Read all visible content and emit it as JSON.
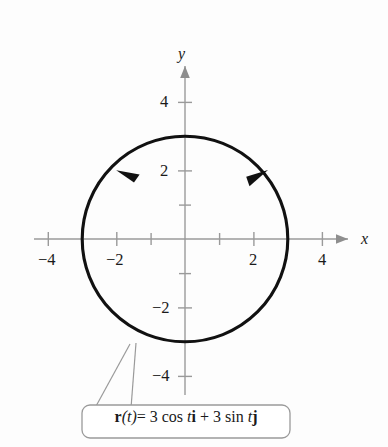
{
  "figure": {
    "type": "parametric-curve-plot"
  },
  "axes": {
    "x_label": "x",
    "y_label": "y",
    "x_ticks_labeled": [
      {
        "value": -4,
        "text": "−4"
      },
      {
        "value": -2,
        "text": "−2"
      },
      {
        "value": 2,
        "text": "2"
      },
      {
        "value": 4,
        "text": "4"
      }
    ],
    "y_ticks_labeled": [
      {
        "value": 4,
        "text": "4"
      },
      {
        "value": 2,
        "text": "2"
      },
      {
        "value": -2,
        "text": "−2"
      },
      {
        "value": -4,
        "text": "−4"
      }
    ],
    "x_ticks_all": [
      -4,
      -3,
      -2,
      -1,
      1,
      2,
      3,
      4
    ],
    "y_ticks_all": [
      -4,
      -3,
      -2,
      -1,
      1,
      2,
      3,
      4
    ],
    "xlim": [
      -4.6,
      4.6
    ],
    "ylim": [
      -4.6,
      4.6
    ],
    "grid": false
  },
  "curve": {
    "equation_parts": {
      "r": "r",
      "paren_t": "(t)",
      "equals": "= 3 cos ",
      "t1": "t",
      "i": "i",
      "plus": " + 3 sin ",
      "t2": "t",
      "j": "j"
    },
    "center": [
      0,
      0
    ],
    "radius": 3,
    "orientation": "counterclockwise",
    "direction_arrows": [
      {
        "angle_deg": 132,
        "points": "counterclockwise"
      },
      {
        "angle_deg": 38,
        "points": "counterclockwise"
      }
    ],
    "color": "#111111"
  },
  "colors": {
    "axis": "#9a9a9a",
    "curve": "#111111",
    "text": "#1a1a1a",
    "background": "#fdfdfd"
  }
}
